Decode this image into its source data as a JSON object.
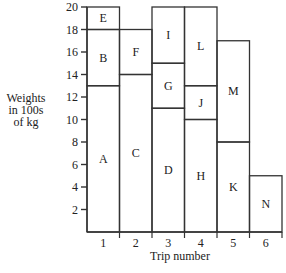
{
  "chart_data": {
    "type": "bar",
    "subtype": "stacked-block",
    "title": "",
    "xlabel": "Trip number",
    "ylabel": "Weights in 100s of kg",
    "ylabel_lines": [
      "Weights",
      "in 100s",
      "of kg"
    ],
    "categories": [
      "1",
      "2",
      "3",
      "4",
      "5",
      "6"
    ],
    "yticks": [
      2,
      4,
      6,
      8,
      10,
      12,
      14,
      16,
      18,
      20
    ],
    "ylim": [
      0,
      20
    ],
    "grid": false,
    "legend": null,
    "trips": [
      {
        "trip": "1",
        "blocks": [
          {
            "label": "A",
            "from": 0,
            "to": 13
          },
          {
            "label": "B",
            "from": 13,
            "to": 18
          },
          {
            "label": "E",
            "from": 18,
            "to": 20
          }
        ]
      },
      {
        "trip": "2",
        "blocks": [
          {
            "label": "C",
            "from": 0,
            "to": 14
          },
          {
            "label": "F",
            "from": 14,
            "to": 18
          }
        ]
      },
      {
        "trip": "3",
        "blocks": [
          {
            "label": "D",
            "from": 0,
            "to": 11
          },
          {
            "label": "G",
            "from": 11,
            "to": 15
          },
          {
            "label": "I",
            "from": 15,
            "to": 20
          }
        ]
      },
      {
        "trip": "4",
        "blocks": [
          {
            "label": "H",
            "from": 0,
            "to": 10
          },
          {
            "label": "J",
            "from": 10,
            "to": 13
          },
          {
            "label": "L",
            "from": 13,
            "to": 20
          }
        ]
      },
      {
        "trip": "5",
        "blocks": [
          {
            "label": "K",
            "from": 0,
            "to": 8
          },
          {
            "label": "M",
            "from": 8,
            "to": 17
          }
        ]
      },
      {
        "trip": "6",
        "blocks": [
          {
            "label": "N",
            "from": 0,
            "to": 5
          }
        ]
      }
    ],
    "series": [
      {
        "name": "block 1 (bottom)",
        "values": [
          13,
          14,
          11,
          10,
          8,
          5
        ],
        "labels": [
          "A",
          "C",
          "D",
          "H",
          "K",
          "N"
        ]
      },
      {
        "name": "block 2",
        "values": [
          5,
          4,
          4,
          3,
          9,
          0
        ],
        "labels": [
          "B",
          "F",
          "G",
          "J",
          "M",
          ""
        ]
      },
      {
        "name": "block 3 (top)",
        "values": [
          2,
          0,
          5,
          7,
          0,
          0
        ],
        "labels": [
          "E",
          "",
          "I",
          "L",
          "",
          ""
        ]
      }
    ]
  }
}
